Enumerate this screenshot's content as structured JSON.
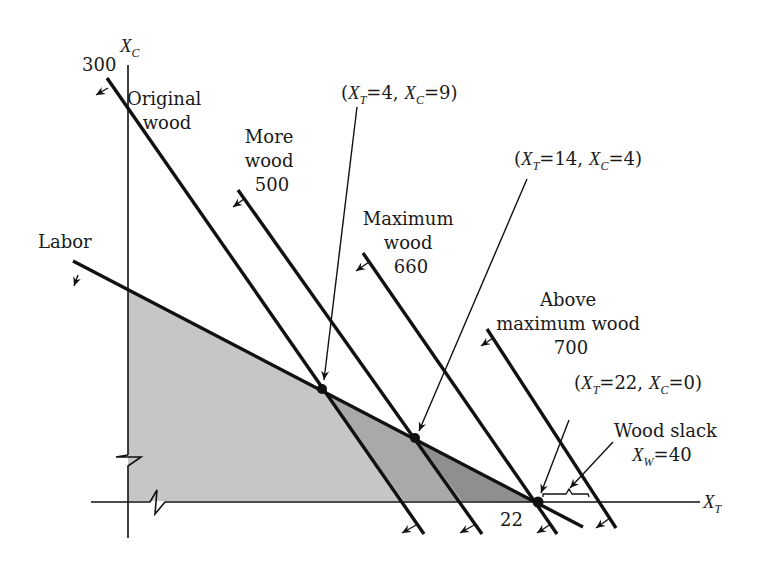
{
  "diagram": {
    "type": "linear-programming-feasible-region",
    "colors": {
      "region_original": "#c6c6c6",
      "region_more_wood": "#a9a9a9",
      "region_max_wood": "#8f8f8f",
      "line": "#111111"
    },
    "axes": {
      "y_axis": {
        "symbol": "X",
        "subscript": "C",
        "tick_label": "300"
      },
      "x_axis": {
        "symbol": "X",
        "subscript": "T",
        "tick_label": "22"
      }
    },
    "constraint_lines": [
      {
        "id": "labor",
        "label_lines": [
          "Labor"
        ]
      },
      {
        "id": "original-wood",
        "label_lines": [
          "Original",
          "wood"
        ]
      },
      {
        "id": "more-wood",
        "label_lines": [
          "More",
          "wood",
          "500"
        ]
      },
      {
        "id": "maximum-wood",
        "label_lines": [
          "Maximum",
          "wood",
          "660"
        ]
      },
      {
        "id": "above-maximum-wood",
        "label_lines": [
          "Above",
          "maximum wood",
          "700"
        ]
      }
    ],
    "points": [
      {
        "id": "p1",
        "open": "(",
        "x_sym": "X",
        "x_sub": "T",
        "x_val": "=4, ",
        "y_sym": "X",
        "y_sub": "C",
        "y_val": "=9)"
      },
      {
        "id": "p2",
        "open": "(",
        "x_sym": "X",
        "x_sub": "T",
        "x_val": "=14, ",
        "y_sym": "X",
        "y_sub": "C",
        "y_val": "=4)"
      },
      {
        "id": "p3",
        "open": "(",
        "x_sym": "X",
        "x_sub": "T",
        "x_val": "=22, ",
        "y_sym": "X",
        "y_sub": "C",
        "y_val": "=0)"
      }
    ],
    "slack": {
      "title": "Wood slack",
      "symbol": "X",
      "subscript": "W",
      "value": "=40"
    }
  }
}
